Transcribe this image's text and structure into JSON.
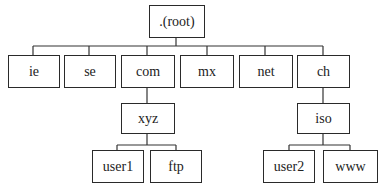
{
  "diagram": {
    "type": "tree",
    "title": "",
    "nodes": [
      {
        "id": "root",
        "label": ".(root)",
        "parent": null
      },
      {
        "id": "ie",
        "label": "ie",
        "parent": "root"
      },
      {
        "id": "se",
        "label": "se",
        "parent": "root"
      },
      {
        "id": "com",
        "label": "com",
        "parent": "root"
      },
      {
        "id": "mx",
        "label": "mx",
        "parent": "root"
      },
      {
        "id": "net",
        "label": "net",
        "parent": "root"
      },
      {
        "id": "ch",
        "label": "ch",
        "parent": "root"
      },
      {
        "id": "xyz",
        "label": "xyz",
        "parent": "com"
      },
      {
        "id": "iso",
        "label": "iso",
        "parent": "ch"
      },
      {
        "id": "user1",
        "label": "user1",
        "parent": "xyz"
      },
      {
        "id": "ftp",
        "label": "ftp",
        "parent": "xyz"
      },
      {
        "id": "user2",
        "label": "user2",
        "parent": "iso"
      },
      {
        "id": "www",
        "label": "www",
        "parent": "iso"
      }
    ]
  }
}
